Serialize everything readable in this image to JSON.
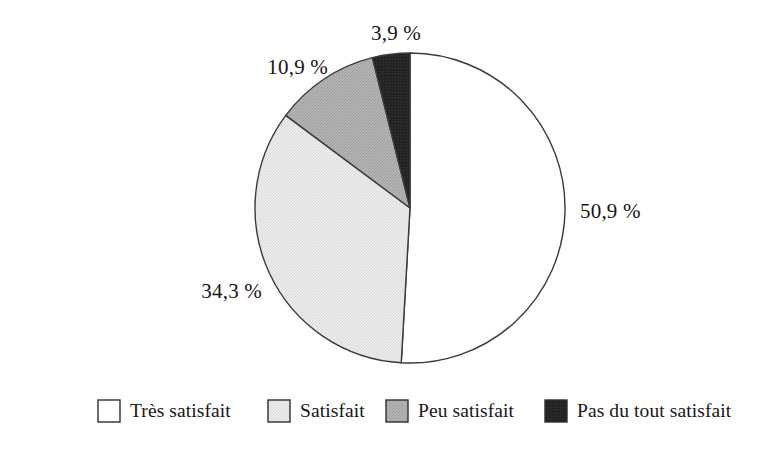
{
  "chart_data": {
    "type": "pie",
    "title": "",
    "subtitle": "",
    "xlabel": "",
    "ylabel": "",
    "legend_position": "bottom",
    "grid": false,
    "start_angle_deg": 0,
    "direction": "clockwise",
    "categories": [
      "Très satisfait",
      "Satisfait",
      "Peu satisfait",
      "Pas du tout satisfait"
    ],
    "values": [
      50.9,
      34.3,
      10.9,
      3.9
    ],
    "value_labels": [
      "50,9 %",
      "34,3 %",
      "10,9 %",
      "3,9 %"
    ],
    "colors": [
      "#ffffff",
      "#e3e3e3",
      "#a9a9a9",
      "#232323"
    ],
    "slices": [
      {
        "label": "Très satisfait",
        "value": 50.9,
        "value_label": "50,9 %",
        "color": "#ffffff",
        "label_x": 580,
        "label_y": 218,
        "label_anchor": "start"
      },
      {
        "label": "Satisfait",
        "value": 34.3,
        "value_label": "34,3 %",
        "color": "#e3e3e3",
        "label_x": 262,
        "label_y": 298,
        "label_anchor": "end"
      },
      {
        "label": "Peu satisfait",
        "value": 10.9,
        "value_label": "10,9 %",
        "color": "#a9a9a9",
        "label_x": 328,
        "label_y": 74,
        "label_anchor": "end"
      },
      {
        "label": "Pas du tout satisfait",
        "value": 3.9,
        "value_label": "3,9 %",
        "color": "#232323",
        "label_x": 396,
        "label_y": 40,
        "label_anchor": "middle"
      }
    ]
  },
  "geometry": {
    "center_x": 410,
    "center_y": 208,
    "radius": 155
  },
  "legend": {
    "items": [
      {
        "label": "Très satisfait",
        "color": "#ffffff",
        "swatch_x": 98,
        "text_x": 130
      },
      {
        "label": "Satisfait",
        "color": "#e3e3e3",
        "swatch_x": 268,
        "text_x": 300
      },
      {
        "label": "Peu satisfait",
        "color": "#a9a9a9",
        "swatch_x": 386,
        "text_x": 418
      },
      {
        "label": "Pas du tout satisfait",
        "color": "#232323",
        "swatch_x": 545,
        "text_x": 577
      }
    ],
    "swatch_y": 400,
    "swatch_size": 22,
    "text_baseline_y": 417
  }
}
